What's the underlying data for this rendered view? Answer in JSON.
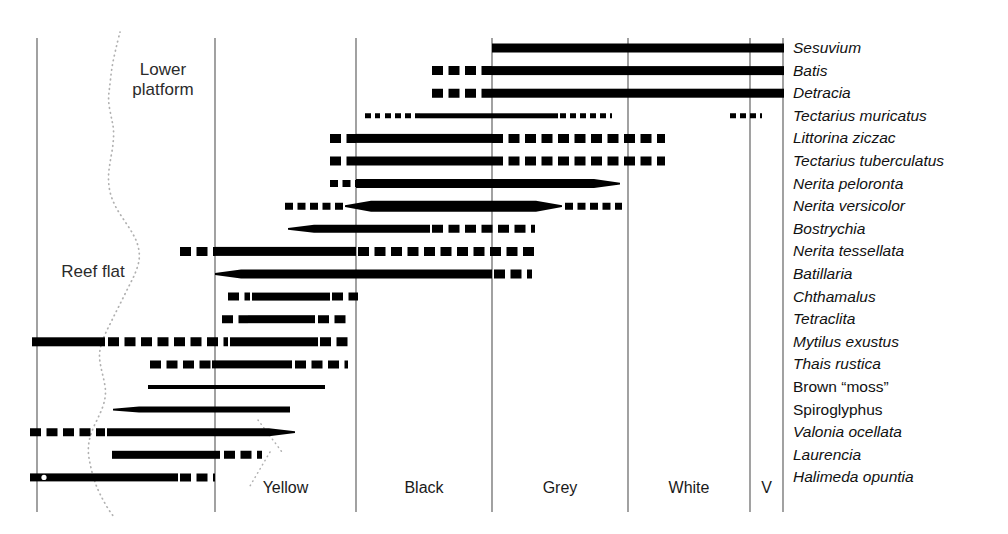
{
  "figure": {
    "background": "#ffffff",
    "ink": "#000000",
    "axis_color": "#555555",
    "shore_color": "#b0b0b0"
  },
  "regions": [
    {
      "name": "lower-platform",
      "label": "Lower\nplatform",
      "x": 163,
      "y": 60
    },
    {
      "name": "reef-flat",
      "label": "Reef flat",
      "x": 93,
      "y": 262
    }
  ],
  "zones": [
    {
      "name": "zone-yellow",
      "label": "Yellow",
      "x0": 215,
      "x1": 356
    },
    {
      "name": "zone-black",
      "label": "Black",
      "x0": 356,
      "x1": 492
    },
    {
      "name": "zone-grey",
      "label": "Grey",
      "x0": 492,
      "x1": 628
    },
    {
      "name": "zone-white",
      "label": "White",
      "x0": 628,
      "x1": 750
    },
    {
      "name": "zone-v",
      "label": "V",
      "x0": 750,
      "x1": 783
    }
  ],
  "gridlines_x": [
    37,
    215,
    356,
    492,
    628,
    750,
    783
  ],
  "grid_top": 38,
  "grid_bottom": 512,
  "row_first_y": 48,
  "row_step": 22.6,
  "chart_data": {
    "type": "bar",
    "xlabel": "Shore zone",
    "ylabel": "Taxon",
    "x_zones": [
      "Reef flat / Lower platform",
      "Yellow",
      "Black",
      "Grey",
      "White",
      "V"
    ],
    "grid": true,
    "legend": "none",
    "species": [
      {
        "name": "Sesuvium",
        "italic": true,
        "segments": [
          {
            "x0": 492,
            "x1": 784,
            "style": "solid",
            "weight": 9,
            "taper": "none"
          }
        ]
      },
      {
        "name": "Batis",
        "italic": true,
        "segments": [
          {
            "x0": 432,
            "x1": 492,
            "style": "dashed",
            "weight": 9,
            "taper": "none"
          },
          {
            "x0": 492,
            "x1": 784,
            "style": "solid",
            "weight": 9,
            "taper": "none"
          }
        ]
      },
      {
        "name": "Detracia",
        "italic": true,
        "segments": [
          {
            "x0": 432,
            "x1": 492,
            "style": "dashed",
            "weight": 9,
            "taper": "none"
          },
          {
            "x0": 492,
            "x1": 784,
            "style": "solid",
            "weight": 9,
            "taper": "none"
          }
        ]
      },
      {
        "name": "Tectarius muricatus",
        "italic": true,
        "segments": [
          {
            "x0": 365,
            "x1": 380,
            "style": "dashed",
            "weight": 5,
            "taper": "none"
          },
          {
            "x0": 385,
            "x1": 420,
            "style": "dashed",
            "weight": 5,
            "taper": "none"
          },
          {
            "x0": 420,
            "x1": 558,
            "style": "solid",
            "weight": 5,
            "taper": "none"
          },
          {
            "x0": 560,
            "x1": 612,
            "style": "dashed",
            "weight": 5,
            "taper": "none"
          },
          {
            "x0": 730,
            "x1": 762,
            "style": "dashed",
            "weight": 5,
            "taper": "none"
          }
        ]
      },
      {
        "name": "Littorina ziczac",
        "italic": true,
        "segments": [
          {
            "x0": 330,
            "x1": 356,
            "style": "dashed",
            "weight": 9,
            "taper": "none"
          },
          {
            "x0": 356,
            "x1": 492,
            "style": "solid",
            "weight": 9,
            "taper": "none"
          },
          {
            "x0": 492,
            "x1": 665,
            "style": "dashed",
            "weight": 9,
            "taper": "none"
          }
        ]
      },
      {
        "name": "Tectarius tuberculatus",
        "italic": true,
        "segments": [
          {
            "x0": 330,
            "x1": 356,
            "style": "dashed",
            "weight": 9,
            "taper": "none"
          },
          {
            "x0": 356,
            "x1": 492,
            "style": "solid",
            "weight": 9,
            "taper": "none"
          },
          {
            "x0": 492,
            "x1": 665,
            "style": "dashed",
            "weight": 9,
            "taper": "none"
          }
        ]
      },
      {
        "name": "Nerita peloronta",
        "italic": true,
        "segments": [
          {
            "x0": 330,
            "x1": 356,
            "style": "dashed",
            "weight": 7,
            "taper": "none"
          },
          {
            "x0": 356,
            "x1": 620,
            "style": "solid",
            "weight": 9,
            "taper": "right"
          }
        ]
      },
      {
        "name": "Nerita versicolor",
        "italic": true,
        "segments": [
          {
            "x0": 285,
            "x1": 345,
            "style": "dashed",
            "weight": 7,
            "taper": "none"
          },
          {
            "x0": 345,
            "x1": 562,
            "style": "solid",
            "weight": 11,
            "taper": "both"
          },
          {
            "x0": 565,
            "x1": 622,
            "style": "dashed",
            "weight": 7,
            "taper": "none"
          }
        ]
      },
      {
        "name": "Bostrychia",
        "italic": true,
        "segments": [
          {
            "x0": 288,
            "x1": 430,
            "style": "solid",
            "weight": 8,
            "taper": "left"
          },
          {
            "x0": 432,
            "x1": 535,
            "style": "dashed",
            "weight": 8,
            "taper": "none"
          }
        ]
      },
      {
        "name": "Nerita tessellata",
        "italic": true,
        "segments": [
          {
            "x0": 180,
            "x1": 215,
            "style": "dashed",
            "weight": 9,
            "taper": "none"
          },
          {
            "x0": 215,
            "x1": 356,
            "style": "solid",
            "weight": 9,
            "taper": "none"
          },
          {
            "x0": 358,
            "x1": 535,
            "style": "dashed",
            "weight": 9,
            "taper": "none"
          }
        ]
      },
      {
        "name": "Batillaria",
        "italic": true,
        "segments": [
          {
            "x0": 215,
            "x1": 492,
            "style": "solid",
            "weight": 9,
            "taper": "left"
          },
          {
            "x0": 494,
            "x1": 532,
            "style": "dashed",
            "weight": 9,
            "taper": "none"
          }
        ]
      },
      {
        "name": "Chthamalus",
        "italic": true,
        "segments": [
          {
            "x0": 228,
            "x1": 250,
            "style": "dashed",
            "weight": 8,
            "taper": "none"
          },
          {
            "x0": 252,
            "x1": 330,
            "style": "solid",
            "weight": 8,
            "taper": "none"
          },
          {
            "x0": 332,
            "x1": 358,
            "style": "dashed",
            "weight": 8,
            "taper": "none"
          }
        ]
      },
      {
        "name": "Tetraclita",
        "italic": true,
        "segments": [
          {
            "x0": 222,
            "x1": 248,
            "style": "dashed",
            "weight": 8,
            "taper": "none"
          },
          {
            "x0": 248,
            "x1": 315,
            "style": "solid",
            "weight": 8,
            "taper": "none"
          },
          {
            "x0": 318,
            "x1": 348,
            "style": "dashed",
            "weight": 8,
            "taper": "none"
          }
        ]
      },
      {
        "name": "Mytilus exustus",
        "italic": true,
        "segments": [
          {
            "x0": 32,
            "x1": 105,
            "style": "solid",
            "weight": 9,
            "taper": "none"
          },
          {
            "x0": 108,
            "x1": 228,
            "style": "dashed",
            "weight": 9,
            "taper": "none"
          },
          {
            "x0": 230,
            "x1": 318,
            "style": "solid",
            "weight": 9,
            "taper": "none"
          },
          {
            "x0": 320,
            "x1": 348,
            "style": "dashed",
            "weight": 9,
            "taper": "none"
          }
        ]
      },
      {
        "name": "Thais rustica",
        "italic": true,
        "segments": [
          {
            "x0": 150,
            "x1": 212,
            "style": "dashed",
            "weight": 8,
            "taper": "none"
          },
          {
            "x0": 212,
            "x1": 292,
            "style": "solid",
            "weight": 8,
            "taper": "none"
          },
          {
            "x0": 295,
            "x1": 348,
            "style": "dashed",
            "weight": 8,
            "taper": "none"
          }
        ]
      },
      {
        "name": "Brown “moss”",
        "italic": false,
        "segments": [
          {
            "x0": 148,
            "x1": 290,
            "style": "solid",
            "weight": 4,
            "taper": "none"
          },
          {
            "x0": 245,
            "x1": 325,
            "style": "solid",
            "weight": 4,
            "taper": "none"
          }
        ]
      },
      {
        "name": "Spiroglyphus",
        "italic": false,
        "segments": [
          {
            "x0": 113,
            "x1": 290,
            "style": "solid",
            "weight": 6,
            "taper": "left"
          }
        ]
      },
      {
        "name": "Valonia ocellata",
        "italic": true,
        "segments": [
          {
            "x0": 30,
            "x1": 105,
            "style": "dashed",
            "weight": 8,
            "taper": "none"
          },
          {
            "x0": 107,
            "x1": 295,
            "style": "solid",
            "weight": 8,
            "taper": "right"
          }
        ]
      },
      {
        "name": "Laurencia",
        "italic": true,
        "segments": [
          {
            "x0": 112,
            "x1": 220,
            "style": "solid",
            "weight": 8,
            "taper": "none"
          },
          {
            "x0": 224,
            "x1": 262,
            "style": "dashed",
            "weight": 8,
            "taper": "none"
          }
        ]
      },
      {
        "name": "Halimeda opuntia",
        "italic": true,
        "segments": [
          {
            "x0": 30,
            "x1": 178,
            "style": "solid",
            "weight": 8,
            "taper": "none"
          },
          {
            "x0": 180,
            "x1": 215,
            "style": "dashed",
            "weight": 8,
            "taper": "none"
          }
        ]
      }
    ]
  },
  "shoreline": {
    "name": "dotted-shore-curve",
    "points": [
      [
        120,
        32
      ],
      [
        116,
        48
      ],
      [
        112,
        66
      ],
      [
        110,
        84
      ],
      [
        108,
        100
      ],
      [
        111,
        116
      ],
      [
        114,
        130
      ],
      [
        113,
        146
      ],
      [
        110,
        162
      ],
      [
        108,
        178
      ],
      [
        110,
        194
      ],
      [
        116,
        208
      ],
      [
        124,
        220
      ],
      [
        132,
        232
      ],
      [
        138,
        244
      ],
      [
        140,
        258
      ],
      [
        136,
        272
      ],
      [
        130,
        284
      ],
      [
        124,
        296
      ],
      [
        118,
        308
      ],
      [
        112,
        320
      ],
      [
        106,
        332
      ],
      [
        101,
        344
      ],
      [
        99,
        356
      ],
      [
        101,
        368
      ],
      [
        104,
        380
      ],
      [
        106,
        392
      ],
      [
        104,
        404
      ],
      [
        99,
        416
      ],
      [
        93,
        428
      ],
      [
        89,
        440
      ],
      [
        88,
        452
      ],
      [
        90,
        464
      ],
      [
        93,
        476
      ],
      [
        97,
        488
      ],
      [
        103,
        500
      ],
      [
        110,
        512
      ],
      [
        118,
        522
      ]
    ]
  }
}
